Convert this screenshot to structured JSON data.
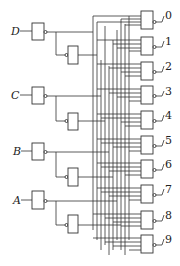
{
  "diagram": {
    "type": "BCD-to-decimal decoder logic circuit",
    "inputs": [
      {
        "label": "D",
        "y": 31
      },
      {
        "label": "C",
        "y": 95
      },
      {
        "label": "B",
        "y": 151
      },
      {
        "label": "A",
        "y": 200
      }
    ],
    "outputs": [
      {
        "label": "0",
        "y": 20
      },
      {
        "label": "1",
        "y": 45
      },
      {
        "label": "2",
        "y": 70
      },
      {
        "label": "3",
        "y": 95
      },
      {
        "label": "4",
        "y": 120
      },
      {
        "label": "5",
        "y": 145
      },
      {
        "label": "6",
        "y": 169
      },
      {
        "label": "7",
        "y": 194
      },
      {
        "label": "8",
        "y": 220
      },
      {
        "label": "9",
        "y": 245
      }
    ],
    "gate_type": "NAND",
    "colors": {
      "line": "#333333",
      "background": "#ffffff"
    }
  }
}
